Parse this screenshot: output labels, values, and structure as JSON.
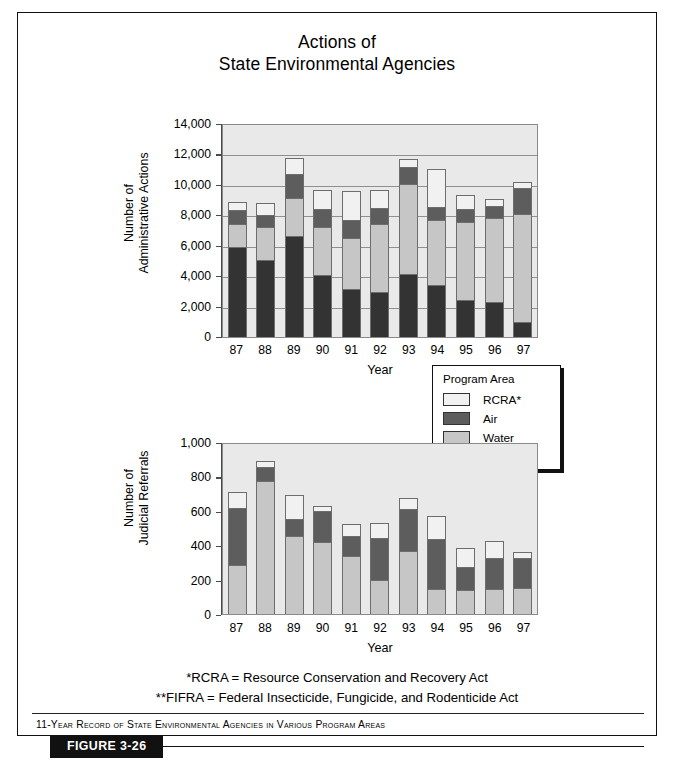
{
  "figure": {
    "title_line1": "Actions of",
    "title_line2": "State Environmental Agencies",
    "caption": "11-Year Record of State Environmental Agencies in Various Program Areas",
    "figure_tag": "FIGURE 3-26",
    "footnote1": "*RCRA = Resource Conservation and Recovery Act",
    "footnote2": "**FIFRA = Federal Insecticide, Fungicide, and Rodenticide Act"
  },
  "legend": {
    "title": "Program Area",
    "entries": [
      {
        "label": "RCRA*",
        "color": "#f1f1f1"
      },
      {
        "label": "Air",
        "color": "#5d5d5d"
      },
      {
        "label": "Water",
        "color": "#c6c6c6"
      },
      {
        "label": "FIFRA**",
        "color": "#333333"
      }
    ]
  },
  "colors": {
    "rcra": "#f1f1f1",
    "air": "#5d5d5d",
    "water": "#c6c6c6",
    "fifra": "#333333",
    "plot_background": "#e9e9e9",
    "grid": "#8f8f8f",
    "axis": "#4a4a4a"
  },
  "chart_data": [
    {
      "id": "administrative-actions",
      "type": "bar",
      "stacked": true,
      "title": "Actions of State Environmental Agencies",
      "xlabel": "Year",
      "ylabel": "Number of Administrative Actions",
      "categories": [
        "87",
        "88",
        "89",
        "90",
        "91",
        "92",
        "93",
        "94",
        "95",
        "96",
        "97"
      ],
      "ylim": [
        0,
        14000
      ],
      "yticks": [
        0,
        2000,
        4000,
        6000,
        8000,
        10000,
        12000,
        14000
      ],
      "ytick_labels": [
        "0",
        "2,000",
        "4,000",
        "6,000",
        "8,000",
        "10,000",
        "12,000",
        "14,000"
      ],
      "grid": true,
      "legend_position": "below-right",
      "series": [
        {
          "name": "FIFRA**",
          "color": "#333333",
          "values": [
            5950,
            5100,
            6700,
            4150,
            3200,
            3000,
            4200,
            3500,
            2500,
            2350,
            1050
          ]
        },
        {
          "name": "Water",
          "color": "#c6c6c6",
          "values": [
            1550,
            2200,
            2550,
            3200,
            3400,
            4550,
            5950,
            4300,
            5150,
            5600,
            7150
          ]
        },
        {
          "name": "Air",
          "color": "#5d5d5d",
          "values": [
            1000,
            900,
            1600,
            1200,
            1250,
            1100,
            1150,
            900,
            950,
            800,
            1750
          ]
        },
        {
          "name": "RCRA*",
          "color": "#f1f1f1",
          "values": [
            600,
            800,
            1150,
            1300,
            1950,
            1250,
            600,
            2550,
            950,
            550,
            450
          ]
        }
      ],
      "totals": [
        9100,
        9000,
        12000,
        9850,
        9800,
        9900,
        11900,
        11250,
        9550,
        9300,
        10400
      ]
    },
    {
      "id": "judicial-referrals",
      "type": "bar",
      "stacked": true,
      "xlabel": "Year",
      "ylabel": "Number of Judicial Referrals",
      "categories": [
        "87",
        "88",
        "89",
        "90",
        "91",
        "92",
        "93",
        "94",
        "95",
        "96",
        "97"
      ],
      "ylim": [
        0,
        1000
      ],
      "yticks": [
        0,
        200,
        400,
        600,
        800,
        1000
      ],
      "ytick_labels": [
        "0",
        "200",
        "400",
        "600",
        "800",
        "1,000"
      ],
      "grid": true,
      "series": [
        {
          "name": "Water",
          "color": "#c6c6c6",
          "values": [
            290,
            780,
            460,
            425,
            345,
            205,
            375,
            150,
            145,
            150,
            155
          ]
        },
        {
          "name": "Air",
          "color": "#5d5d5d",
          "values": [
            340,
            85,
            105,
            185,
            120,
            250,
            250,
            295,
            140,
            190,
            185
          ]
        },
        {
          "name": "RCRA*",
          "color": "#f1f1f1",
          "values": [
            95,
            40,
            145,
            35,
            75,
            90,
            65,
            140,
            115,
            100,
            40
          ]
        }
      ],
      "totals": [
        725,
        905,
        710,
        645,
        540,
        545,
        690,
        585,
        400,
        440,
        380
      ]
    }
  ]
}
